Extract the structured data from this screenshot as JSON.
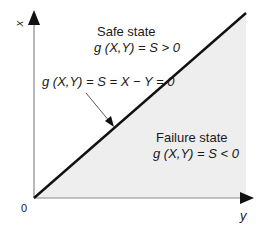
{
  "diagram": {
    "axes": {
      "vertical_label": "x",
      "horizontal_label": "y",
      "origin_label": "0"
    },
    "regions": {
      "safe": {
        "title": "Safe state",
        "equation": "g (X,Y) = S > 0"
      },
      "failure": {
        "title": "Failure state",
        "equation": "g (X,Y) = S < 0",
        "fill": "#eeeeee"
      }
    },
    "boundary": {
      "equation": "g (X,Y) = S = X − Y = 0"
    }
  }
}
